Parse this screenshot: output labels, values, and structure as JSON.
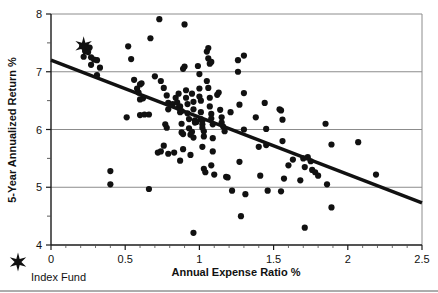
{
  "chart_data": {
    "type": "scatter",
    "title": "",
    "xlabel": "Annual Expense Ratio %",
    "ylabel": "5-Year Annualized Return %",
    "xlim": [
      0,
      2.5
    ],
    "ylim": [
      4,
      8
    ],
    "xticks": [
      0,
      0.5,
      1,
      1.5,
      2,
      2.5
    ],
    "xtick_labels": [
      "0",
      "0.5",
      "1",
      "1.5",
      "2",
      "2.5"
    ],
    "xminor_ticks": [
      0.1,
      0.2,
      0.3,
      0.4,
      0.6,
      0.7,
      0.8,
      0.9,
      1.1,
      1.2,
      1.3,
      1.4,
      1.6,
      1.7,
      1.8,
      1.9,
      2.1,
      2.2,
      2.3,
      2.4
    ],
    "yticks": [
      4,
      5,
      6,
      7,
      8
    ],
    "ytick_labels": [
      "4",
      "5",
      "6",
      "7",
      "8"
    ],
    "yminor_ticks": [
      4.5,
      5.5,
      6.5,
      7.5
    ],
    "grid": "horizontal-major",
    "grid_color": "#8c8c8c",
    "marker_color": "#111111",
    "marker_size": 3.1,
    "trendline": {
      "label": "",
      "color": "#111111",
      "width": 3.4,
      "x": [
        0,
        2.5
      ],
      "y": [
        7.2,
        4.73
      ]
    },
    "legend": {
      "position": "below-left",
      "entries": [
        {
          "label": "Index Fund",
          "marker": "star",
          "color": "#111111"
        }
      ]
    },
    "highlight_point": {
      "label": "Index Fund",
      "x": 0.22,
      "y": 7.45,
      "marker": "star"
    },
    "series": [
      {
        "name": "Actively Managed Funds",
        "marker": "circle",
        "color": "#111111",
        "points": [
          [
            0.21,
            7.44
          ],
          [
            0.24,
            7.43
          ],
          [
            0.26,
            7.42
          ],
          [
            0.23,
            7.36
          ],
          [
            0.25,
            7.34
          ],
          [
            0.22,
            7.26
          ],
          [
            0.27,
            7.25
          ],
          [
            0.29,
            7.21
          ],
          [
            0.31,
            7.2
          ],
          [
            0.27,
            7.12
          ],
          [
            0.33,
            7.07
          ],
          [
            0.31,
            6.94
          ],
          [
            0.4,
            5.28
          ],
          [
            0.4,
            5.05
          ],
          [
            0.52,
            7.44
          ],
          [
            0.54,
            7.22
          ],
          [
            0.51,
            6.21
          ],
          [
            0.56,
            6.86
          ],
          [
            0.58,
            6.71
          ],
          [
            0.59,
            6.64
          ],
          [
            0.6,
            6.78
          ],
          [
            0.61,
            6.8
          ],
          [
            0.6,
            6.52
          ],
          [
            0.62,
            6.54
          ],
          [
            0.6,
            6.25
          ],
          [
            0.63,
            6.26
          ],
          [
            0.66,
            6.26
          ],
          [
            0.66,
            4.97
          ],
          [
            0.67,
            7.58
          ],
          [
            0.7,
            6.92
          ],
          [
            0.73,
            7.91
          ],
          [
            0.74,
            6.84
          ],
          [
            0.76,
            6.72
          ],
          [
            0.78,
            6.59
          ],
          [
            0.79,
            6.46
          ],
          [
            0.79,
            6.35
          ],
          [
            0.77,
            6.09
          ],
          [
            0.78,
            6.03
          ],
          [
            0.76,
            5.72
          ],
          [
            0.74,
            5.62
          ],
          [
            0.72,
            5.6
          ],
          [
            0.79,
            5.58
          ],
          [
            0.83,
            5.6
          ],
          [
            0.82,
            6.44
          ],
          [
            0.84,
            6.55
          ],
          [
            0.85,
            6.47
          ],
          [
            0.86,
            6.62
          ],
          [
            0.86,
            6.38
          ],
          [
            0.87,
            6.4
          ],
          [
            0.87,
            6.3
          ],
          [
            0.88,
            6.32
          ],
          [
            0.88,
            6.1
          ],
          [
            0.88,
            5.95
          ],
          [
            0.89,
            5.92
          ],
          [
            0.9,
            7.09
          ],
          [
            0.9,
            7.82
          ],
          [
            0.89,
            7.05
          ],
          [
            0.91,
            6.68
          ],
          [
            0.91,
            6.55
          ],
          [
            0.92,
            6.44
          ],
          [
            0.92,
            6.28
          ],
          [
            0.93,
            6.18
          ],
          [
            0.93,
            6.02
          ],
          [
            0.94,
            5.91
          ],
          [
            0.89,
            5.66
          ],
          [
            0.87,
            5.46
          ],
          [
            0.95,
            6.62
          ],
          [
            0.96,
            6.48
          ],
          [
            0.96,
            6.35
          ],
          [
            0.97,
            6.16
          ],
          [
            0.97,
            6.12
          ],
          [
            0.98,
            6.13
          ],
          [
            0.95,
            5.96
          ],
          [
            0.96,
            5.86
          ],
          [
            0.94,
            5.56
          ],
          [
            0.96,
            4.21
          ],
          [
            0.99,
            7.1
          ],
          [
            1.0,
            6.96
          ],
          [
            1.0,
            6.71
          ],
          [
            1.0,
            6.57
          ],
          [
            1.01,
            6.5
          ],
          [
            1.01,
            6.3
          ],
          [
            1.01,
            6.18
          ],
          [
            1.02,
            6.15
          ],
          [
            1.02,
            6.09
          ],
          [
            1.02,
            6.03
          ],
          [
            1.03,
            5.97
          ],
          [
            1.03,
            5.88
          ],
          [
            1.02,
            5.7
          ],
          [
            1.03,
            5.32
          ],
          [
            1.04,
            5.26
          ],
          [
            1.05,
            7.35
          ],
          [
            1.06,
            7.41
          ],
          [
            1.06,
            7.23
          ],
          [
            1.07,
            7.14
          ],
          [
            1.08,
            7.17
          ],
          [
            1.05,
            6.84
          ],
          [
            1.06,
            6.72
          ],
          [
            1.07,
            6.55
          ],
          [
            1.07,
            6.4
          ],
          [
            1.08,
            6.27
          ],
          [
            1.08,
            6.19
          ],
          [
            1.09,
            6.09
          ],
          [
            1.09,
            5.85
          ],
          [
            1.09,
            5.62
          ],
          [
            1.08,
            5.38
          ],
          [
            1.1,
            5.22
          ],
          [
            1.12,
            6.6
          ],
          [
            1.13,
            6.64
          ],
          [
            1.14,
            6.34
          ],
          [
            1.15,
            6.21
          ],
          [
            1.15,
            6.12
          ],
          [
            1.16,
            6.05
          ],
          [
            1.17,
            5.97
          ],
          [
            1.18,
            5.18
          ],
          [
            1.19,
            5.17
          ],
          [
            1.21,
            6.3
          ],
          [
            1.22,
            4.94
          ],
          [
            1.26,
            7.0
          ],
          [
            1.26,
            7.2
          ],
          [
            1.27,
            6.43
          ],
          [
            1.27,
            5.44
          ],
          [
            1.28,
            4.5
          ],
          [
            1.3,
            7.28
          ],
          [
            1.3,
            6.63
          ],
          [
            1.3,
            6.0
          ],
          [
            1.31,
            4.88
          ],
          [
            1.38,
            6.21
          ],
          [
            1.4,
            5.7
          ],
          [
            1.41,
            5.2
          ],
          [
            1.44,
            6.46
          ],
          [
            1.45,
            6.01
          ],
          [
            1.45,
            5.73
          ],
          [
            1.46,
            4.94
          ],
          [
            1.54,
            6.35
          ],
          [
            1.55,
            6.33
          ],
          [
            1.56,
            6.17
          ],
          [
            1.56,
            5.8
          ],
          [
            1.57,
            5.15
          ],
          [
            1.55,
            4.93
          ],
          [
            1.6,
            5.38
          ],
          [
            1.63,
            5.48
          ],
          [
            1.68,
            5.12
          ],
          [
            1.7,
            5.5
          ],
          [
            1.71,
            5.35
          ],
          [
            1.71,
            4.3
          ],
          [
            1.73,
            5.52
          ],
          [
            1.75,
            5.45
          ],
          [
            1.76,
            5.3
          ],
          [
            1.78,
            5.26
          ],
          [
            1.8,
            5.2
          ],
          [
            1.85,
            6.1
          ],
          [
            1.86,
            5.05
          ],
          [
            1.89,
            5.74
          ],
          [
            1.89,
            4.65
          ],
          [
            2.07,
            5.78
          ],
          [
            2.19,
            5.22
          ]
        ]
      }
    ]
  },
  "legend": {
    "index_fund_label": "Index Fund",
    "star_glyph": "star-marker"
  },
  "axes": {
    "x_title": "Annual Expense Ratio %",
    "y_title": "5-Year Annualized Return %"
  }
}
